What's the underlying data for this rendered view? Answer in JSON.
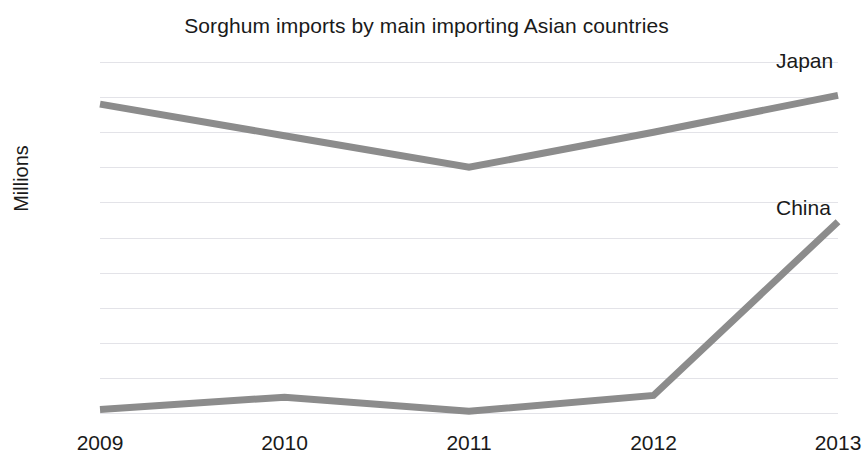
{
  "chart_data": {
    "type": "line",
    "title": "Sorghum imports by main importing Asian countries",
    "xlabel": "",
    "ylabel": "Millions",
    "x": [
      "2009",
      "2010",
      "2011",
      "2012",
      "2013"
    ],
    "categories": [
      "2009",
      "2010",
      "2011",
      "2012",
      "2013"
    ],
    "ylim": [
      0,
      2
    ],
    "y_ticks": [
      "2",
      "1.8",
      "1.6",
      "1.4",
      "1.2",
      "1",
      "0.8",
      "0.6",
      "0.4",
      "0.2",
      "0"
    ],
    "y_tick_values": [
      2,
      1.8,
      1.6,
      1.4,
      1.2,
      1,
      0.8,
      0.6,
      0.4,
      0.2,
      0
    ],
    "grid": true,
    "legend_position": "inline-right-labels",
    "series": [
      {
        "name": "Japan",
        "values": [
          1.76,
          1.58,
          1.4,
          1.6,
          1.81
        ],
        "color": "#8c8c8c"
      },
      {
        "name": "China",
        "values": [
          0.02,
          0.09,
          0.01,
          0.1,
          1.09
        ],
        "color": "#8c8c8c"
      }
    ],
    "annotations": [
      {
        "text": "Japan",
        "series": "Japan"
      },
      {
        "text": "China",
        "series": "China"
      }
    ]
  },
  "colors": {
    "line": "#8c8c8c",
    "gridline": "#e3e3e8",
    "text": "#1a1a1a",
    "background": "#ffffff"
  }
}
